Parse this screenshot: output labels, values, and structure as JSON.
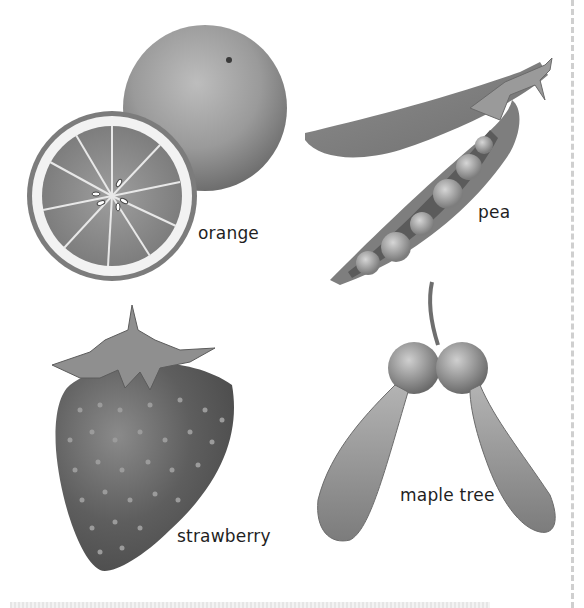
{
  "figure": {
    "items": [
      {
        "id": "orange",
        "label": "orange"
      },
      {
        "id": "pea",
        "label": "pea"
      },
      {
        "id": "strawberry",
        "label": "strawberry"
      },
      {
        "id": "maple",
        "label": "maple tree"
      }
    ]
  },
  "colors": {
    "ink": "#1f1f1f",
    "illustration_dark": "#5a5a5a",
    "illustration_mid": "#8a8a8a",
    "illustration_light": "#c8c8c8",
    "page_edge": "#cfcfcf"
  }
}
